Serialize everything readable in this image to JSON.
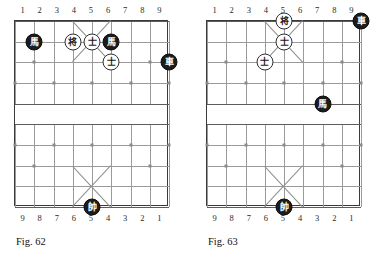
{
  "page": {
    "background": "#ffffff",
    "piece_red_color": "#ffffff",
    "piece_black_color": "#1c1c1c",
    "grid_color": "#9a9a9a",
    "border_color": "#3a3a3a"
  },
  "figures": [
    {
      "id": "fig-62",
      "caption": "Fig. 62",
      "coords_top": [
        "1",
        "2",
        "3",
        "4",
        "5",
        "6",
        "7",
        "8",
        "9"
      ],
      "coords_bottom": [
        "9",
        "8",
        "7",
        "6",
        "5",
        "4",
        "3",
        "2",
        "1"
      ],
      "pieces": [
        {
          "name": "black-horse-file2",
          "glyph": "馬",
          "side": "black",
          "file": 2,
          "rank": 2
        },
        {
          "name": "red-general-file4",
          "glyph": "将",
          "side": "red",
          "file": 4,
          "rank": 2
        },
        {
          "name": "red-advisor-file5",
          "glyph": "士",
          "side": "red",
          "file": 5,
          "rank": 2
        },
        {
          "name": "black-horse-file6",
          "glyph": "馬",
          "side": "black",
          "file": 6,
          "rank": 2
        },
        {
          "name": "red-advisor-file6",
          "glyph": "士",
          "side": "red",
          "file": 6,
          "rank": 3
        },
        {
          "name": "black-chariot-file9",
          "glyph": "車",
          "side": "black",
          "file": 9,
          "rank": 3
        },
        {
          "name": "black-marshal-file5",
          "glyph": "帥",
          "side": "black",
          "file": 5,
          "rank": 10
        }
      ]
    },
    {
      "id": "fig-63",
      "caption": "Fig. 63",
      "coords_top": [
        "1",
        "2",
        "3",
        "4",
        "5",
        "6",
        "7",
        "8",
        "9"
      ],
      "coords_bottom": [
        "9",
        "8",
        "7",
        "6",
        "5",
        "4",
        "3",
        "2",
        "1"
      ],
      "pieces": [
        {
          "name": "red-general-file5",
          "glyph": "将",
          "side": "red",
          "file": 5,
          "rank": 1
        },
        {
          "name": "black-chariot-file9",
          "glyph": "車",
          "side": "black",
          "file": 9,
          "rank": 1
        },
        {
          "name": "red-advisor-file5",
          "glyph": "士",
          "side": "red",
          "file": 5,
          "rank": 2
        },
        {
          "name": "red-advisor-file4",
          "glyph": "士",
          "side": "red",
          "file": 4,
          "rank": 3
        },
        {
          "name": "black-horse-file7",
          "glyph": "馬",
          "side": "black",
          "file": 7,
          "rank": 5
        },
        {
          "name": "black-marshal-file5",
          "glyph": "帥",
          "side": "black",
          "file": 5,
          "rank": 10
        }
      ]
    }
  ]
}
